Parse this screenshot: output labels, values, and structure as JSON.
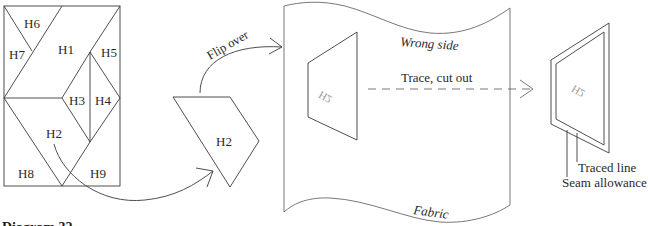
{
  "diagram": {
    "type": "quilt-piece-cutting-instructions",
    "block": {
      "pieces": [
        "H1",
        "H2",
        "H3",
        "H4",
        "H5",
        "H6",
        "H7",
        "H8",
        "H9"
      ]
    },
    "isolated_piece": {
      "label": "H2"
    },
    "steps": {
      "flip": "Flip over",
      "trace": "Trace, cut out"
    },
    "fabric": {
      "side_label": "Wrong side",
      "name_label": "Fabric",
      "traced_piece_label": "H2"
    },
    "cut_piece": {
      "label": "H2",
      "callouts": {
        "traced_line": "Traced line",
        "seam_allowance": "Seam allowance"
      }
    },
    "caption": "Diagram 32"
  },
  "colors": {
    "line": "#3a3a3a",
    "ghost_text": "#9a9a9a",
    "background": "#ffffff"
  }
}
